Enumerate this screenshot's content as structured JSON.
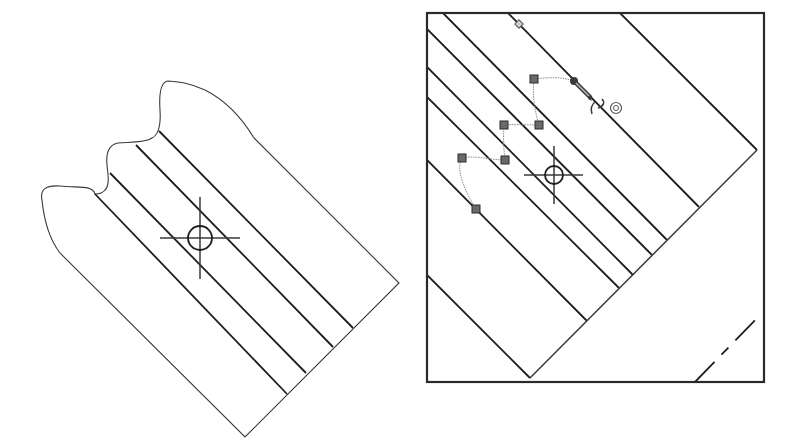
{
  "figure": {
    "left_panel": {
      "label": "tooth-profile-with-centerline-hatch",
      "crosshair": {
        "x": 200,
        "y": 238
      },
      "hatch_lines": 4
    },
    "right_panel": {
      "label": "zoomed-viewport-with-spline-handles",
      "crosshair": {
        "x": 554,
        "y": 175
      },
      "spline_handles": 6,
      "cursor": "pencil-icon"
    },
    "colors": {
      "line": "#1e1e1e",
      "spline": "#8a8a8a",
      "handle": "#6a6a6a",
      "background": "#ffffff"
    }
  }
}
